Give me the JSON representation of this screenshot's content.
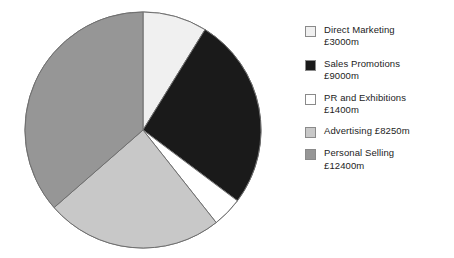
{
  "chart_data": {
    "type": "pie",
    "title": "",
    "currency": "£",
    "unit": "m",
    "total": 34050,
    "categories": [
      "Direct Marketing",
      "Sales Promotions",
      "PR and Exhibitions",
      "Advertising",
      "Personal Selling"
    ],
    "values": [
      3000,
      9000,
      1400,
      8250,
      12400
    ],
    "value_labels": [
      "£3000m",
      "£9000m",
      "£1400m",
      "£8250m",
      "£12400m"
    ],
    "colors": [
      "#f0f0f0",
      "#1a1a1a",
      "#ffffff",
      "#c8c8c8",
      "#969696"
    ],
    "start_angle_deg": 0,
    "direction": "clockwise",
    "legend_position": "right",
    "grid": false,
    "slices": [
      {
        "label": "Direct Marketing",
        "value": 3000,
        "value_label": "£3000m",
        "color": "#f0f0f0",
        "percent": 8.8,
        "angle_deg": 31.7
      },
      {
        "label": "Sales Promotions",
        "value": 9000,
        "value_label": "£9000m",
        "color": "#1a1a1a",
        "percent": 26.4,
        "angle_deg": 95.2
      },
      {
        "label": "PR and Exhibitions",
        "value": 1400,
        "value_label": "£1400m",
        "color": "#ffffff",
        "percent": 4.1,
        "angle_deg": 14.8
      },
      {
        "label": "Advertising",
        "value": 8250,
        "value_label": "£8250m",
        "color": "#c8c8c8",
        "percent": 24.2,
        "angle_deg": 87.2
      },
      {
        "label": "Personal Selling",
        "value": 12400,
        "value_label": "£12400m",
        "color": "#969696",
        "percent": 36.4,
        "angle_deg": 131.1
      }
    ]
  },
  "legend": {
    "items": [
      {
        "label": "Direct Marketing",
        "value_label": "£3000m",
        "text": "Direct Marketing\n£3000m",
        "swatch": "#f0f0f0",
        "name": "legend-swatch-direct-marketing"
      },
      {
        "label": "Sales Promotions",
        "value_label": "£9000m",
        "text": "Sales Promotions\n£9000m",
        "swatch": "#1a1a1a",
        "name": "legend-swatch-sales-promotions"
      },
      {
        "label": "PR and Exhibitions",
        "value_label": "£1400m",
        "text": "PR and Exhibitions\n£1400m",
        "swatch": "#ffffff",
        "name": "legend-swatch-pr-and-exhibitions"
      },
      {
        "label": "Advertising",
        "value_label": "£8250m",
        "text": "Advertising £8250m",
        "swatch": "#c8c8c8",
        "name": "legend-swatch-advertising"
      },
      {
        "label": "Personal Selling",
        "value_label": "£12400m",
        "text": "Personal Selling\n£12400m",
        "swatch": "#969696",
        "name": "legend-swatch-personal-selling"
      }
    ]
  },
  "geometry": {
    "center_x": 143,
    "center_y": 130,
    "radius": 118
  }
}
